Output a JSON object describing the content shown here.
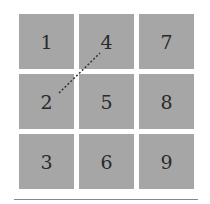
{
  "grid": {
    "tiles": [
      {
        "label": "1",
        "col": 0,
        "row": 0
      },
      {
        "label": "4",
        "col": 1,
        "row": 0
      },
      {
        "label": "7",
        "col": 2,
        "row": 0
      },
      {
        "label": "2",
        "col": 0,
        "row": 1
      },
      {
        "label": "5",
        "col": 1,
        "row": 1
      },
      {
        "label": "8",
        "col": 2,
        "row": 1
      },
      {
        "label": "3",
        "col": 0,
        "row": 2
      },
      {
        "label": "6",
        "col": 1,
        "row": 2
      },
      {
        "label": "9",
        "col": 2,
        "row": 2
      }
    ],
    "connection": {
      "from": "2",
      "to": "4",
      "style": "dotted"
    },
    "colors": {
      "tile": "#a6a6a6",
      "text": "#2a2a2a",
      "line": "#333333"
    }
  }
}
